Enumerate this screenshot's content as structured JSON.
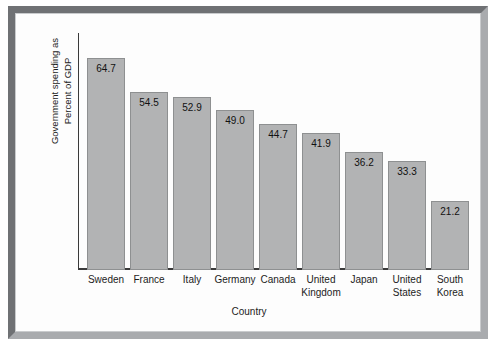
{
  "chart_data": {
    "type": "bar",
    "title": "",
    "xlabel": "Country",
    "ylabel_line1": "Government spending as",
    "ylabel_line2": "Percent of GDP",
    "categories": [
      "Sweden",
      "France",
      "Italy",
      "Germany",
      "Canada",
      "United Kingdom",
      "Japan",
      "United States",
      "South Korea"
    ],
    "category_lines": [
      [
        "Sweden",
        ""
      ],
      [
        "France",
        ""
      ],
      [
        "Italy",
        ""
      ],
      [
        "Germany",
        ""
      ],
      [
        "Canada",
        ""
      ],
      [
        "United",
        "Kingdom"
      ],
      [
        "Japan",
        ""
      ],
      [
        "United",
        "States"
      ],
      [
        "South",
        "Korea"
      ]
    ],
    "values": [
      64.7,
      54.5,
      52.9,
      49.0,
      44.7,
      41.9,
      36.2,
      33.3,
      21.2
    ],
    "value_labels": [
      "64.7",
      "54.5",
      "52.9",
      "49.0",
      "44.7",
      "41.9",
      "36.2",
      "33.3",
      "21.2"
    ],
    "ylim": [
      0,
      70
    ],
    "grid": false,
    "legend": "none",
    "bar_color": "#b2b3b4",
    "bar_border_color": "#8e9091",
    "axis_color": "#3a3a3a",
    "text_color": "#1c1c1c",
    "frame_color_dark": "#6f7174",
    "frame_color_light": "#a9abae",
    "background_color": "#fdfdfd"
  }
}
